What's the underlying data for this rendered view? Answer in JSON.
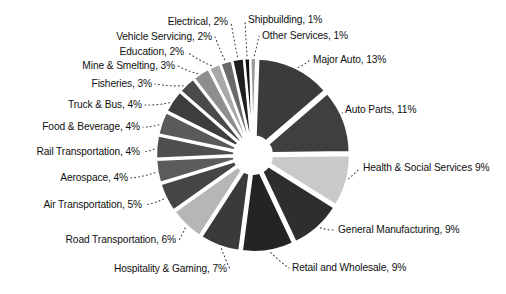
{
  "chart_data": {
    "type": "pie",
    "title": "",
    "subtitle": "",
    "xlabel": "",
    "ylabel": "",
    "legend_position": "none",
    "grid": false,
    "style": "exploded-pie-grayscale",
    "units": "percent",
    "total": 100,
    "categories": [
      "Major Auto",
      "Auto Parts",
      "Health & Social Services",
      "General Manufacturing",
      "Retail and Wholesale",
      "Hospitality & Gaming",
      "Road Transportation",
      "Air Transportation",
      "Aerospace",
      "Rail Transportation",
      "Food & Beverage",
      "Truck & Bus",
      "Fisheries",
      "Mine & Smelting",
      "Education",
      "Vehicle Servicing",
      "Electrical",
      "Shipbuilding",
      "Other Services"
    ],
    "values": [
      13,
      11,
      9,
      9,
      9,
      7,
      6,
      5,
      4,
      4,
      4,
      4,
      3,
      3,
      2,
      2,
      2,
      1,
      1
    ],
    "colors": [
      "#3b3b3b",
      "#3f3f3f",
      "#c9c9c9",
      "#2e2e2e",
      "#242424",
      "#3a3a3a",
      "#b6b6b6",
      "#454545",
      "#5c5c5c",
      "#4e4e4e",
      "#5a5a5a",
      "#3d3d3d",
      "#4a4a4a",
      "#8e8e8e",
      "#a8a8a8",
      "#6a6a6a",
      "#1f1f1f",
      "#111111",
      "#9a9a9a"
    ],
    "slices": [
      {
        "label": "Major Auto, 13%",
        "name": "Major Auto",
        "value": 13,
        "color": "#3b3b3b",
        "side": "right"
      },
      {
        "label": "Auto Parts, 11%",
        "name": "Auto Parts",
        "value": 11,
        "color": "#3f3f3f",
        "side": "right"
      },
      {
        "label": "Health & Social Services 9%",
        "name": "Health & Social Services",
        "value": 9,
        "color": "#c9c9c9",
        "side": "right"
      },
      {
        "label": "General Manufacturing, 9%",
        "name": "General Manufacturing",
        "value": 9,
        "color": "#2e2e2e",
        "side": "right"
      },
      {
        "label": "Retail and Wholesale, 9%",
        "name": "Retail and Wholesale",
        "value": 9,
        "color": "#242424",
        "side": "right"
      },
      {
        "label": "Hospitality & Gaming, 7%",
        "name": "Hospitality & Gaming",
        "value": 7,
        "color": "#3a3a3a",
        "side": "left"
      },
      {
        "label": "Road Transportation, 6%",
        "name": "Road Transportation",
        "value": 6,
        "color": "#b6b6b6",
        "side": "left"
      },
      {
        "label": "Air Transportation, 5%",
        "name": "Air Transportation",
        "value": 5,
        "color": "#454545",
        "side": "left"
      },
      {
        "label": "Aerospace, 4%",
        "name": "Aerospace",
        "value": 4,
        "color": "#5c5c5c",
        "side": "left"
      },
      {
        "label": "Rail Transportation, 4%",
        "name": "Rail Transportation",
        "value": 4,
        "color": "#4e4e4e",
        "side": "left"
      },
      {
        "label": "Food & Beverage, 4%",
        "name": "Food & Beverage",
        "value": 4,
        "color": "#5a5a5a",
        "side": "left"
      },
      {
        "label": "Truck & Bus, 4%",
        "name": "Truck & Bus",
        "value": 4,
        "color": "#3d3d3d",
        "side": "left"
      },
      {
        "label": "Fisheries, 3%",
        "name": "Fisheries",
        "value": 3,
        "color": "#4a4a4a",
        "side": "left"
      },
      {
        "label": "Mine & Smelting, 3%",
        "name": "Mine & Smelting",
        "value": 3,
        "color": "#8e8e8e",
        "side": "left"
      },
      {
        "label": "Education, 2%",
        "name": "Education",
        "value": 2,
        "color": "#a8a8a8",
        "side": "left"
      },
      {
        "label": "Vehicle Servicing, 2%",
        "name": "Vehicle Servicing",
        "value": 2,
        "color": "#6a6a6a",
        "side": "left"
      },
      {
        "label": "Electrical, 2%",
        "name": "Electrical",
        "value": 2,
        "color": "#1f1f1f",
        "side": "left"
      },
      {
        "label": "Shipbuilding, 1%",
        "name": "Shipbuilding",
        "value": 1,
        "color": "#111111",
        "side": "right"
      },
      {
        "label": "Other Services, 1%",
        "name": "Other Services",
        "value": 1,
        "color": "#9a9a9a",
        "side": "right"
      }
    ],
    "labels": {
      "major_auto": "Major Auto, 13%",
      "auto_parts": "Auto Parts, 11%",
      "health_social_services": "Health & Social Services 9%",
      "general_manufacturing": "General Manufacturing, 9%",
      "retail_and_wholesale": "Retail and Wholesale, 9%",
      "hospitality_gaming": "Hospitality & Gaming, 7%",
      "road_transportation": "Road Transportation, 6%",
      "air_transportation": "Air Transportation, 5%",
      "aerospace": "Aerospace, 4%",
      "rail_transportation": "Rail Transportation, 4%",
      "food_beverage": "Food & Beverage, 4%",
      "truck_bus": "Truck & Bus, 4%",
      "fisheries": "Fisheries, 3%",
      "mine_smelting": "Mine & Smelting, 3%",
      "education": "Education, 2%",
      "vehicle_servicing": "Vehicle Servicing, 2%",
      "electrical": "Electrical, 2%",
      "shipbuilding": "Shipbuilding, 1%",
      "other_services": "Other Services, 1%"
    }
  },
  "geometry": {
    "cx": 253,
    "cy": 155,
    "radius": 92,
    "inner_radius": 14,
    "explode": 5,
    "start_angle_deg": -88
  }
}
